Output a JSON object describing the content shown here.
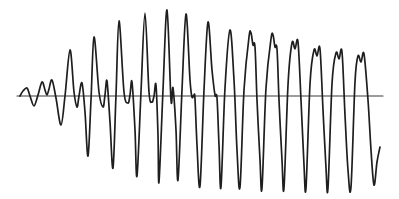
{
  "canvas": {
    "width": 399,
    "height": 199,
    "background": "#ffffff"
  },
  "style": {
    "waveform_stroke": "#1e1e1e",
    "waveform_stroke_width": 1.7,
    "axis_stroke": "#3a3a3a",
    "axis_stroke_width": 1.1
  },
  "chart_data": {
    "type": "line",
    "title": "",
    "xlabel": "",
    "ylabel": "",
    "legend": null,
    "grid": false,
    "annotation": "Hand-drawn waveform trace of an oscillation growing from small ripples into large complex cycles, crossing a single horizontal zero axis",
    "axis_line": {
      "x1": 17,
      "y1": 96,
      "x2": 383,
      "y2": 96
    },
    "series": [
      {
        "name": "waveform",
        "points_px": [
          [
            20,
            96
          ],
          [
            23,
            91
          ],
          [
            27,
            88
          ],
          [
            30,
            96
          ],
          [
            34,
            106
          ],
          [
            38,
            95
          ],
          [
            42,
            82
          ],
          [
            45,
            90
          ],
          [
            47,
            95
          ],
          [
            49,
            89
          ],
          [
            52,
            80
          ],
          [
            56,
            98
          ],
          [
            61,
            125
          ],
          [
            65,
            96
          ],
          [
            70,
            50
          ],
          [
            74,
            92
          ],
          [
            77,
            107
          ],
          [
            79,
            96
          ],
          [
            82,
            83
          ],
          [
            85,
            112
          ],
          [
            88,
            156
          ],
          [
            91,
            100
          ],
          [
            94,
            37
          ],
          [
            99,
            92
          ],
          [
            103,
            107
          ],
          [
            105,
            95
          ],
          [
            107,
            81
          ],
          [
            110,
            122
          ],
          [
            113,
            168
          ],
          [
            116,
            95
          ],
          [
            119,
            21
          ],
          [
            124,
            92
          ],
          [
            128,
            103
          ],
          [
            130,
            95
          ],
          [
            132,
            82
          ],
          [
            135,
            130
          ],
          [
            137,
            176
          ],
          [
            141,
            92
          ],
          [
            145,
            13
          ],
          [
            149,
            92
          ],
          [
            152,
            102
          ],
          [
            154,
            96
          ],
          [
            156,
            85
          ],
          [
            158,
            135
          ],
          [
            159,
            182
          ],
          [
            163,
            90
          ],
          [
            167,
            10
          ],
          [
            171,
            100
          ],
          [
            173,
            88
          ],
          [
            176,
            130
          ],
          [
            178,
            180
          ],
          [
            182,
            90
          ],
          [
            186,
            14
          ],
          [
            190,
            80
          ],
          [
            192,
            97
          ],
          [
            194,
            95
          ],
          [
            195,
            99
          ],
          [
            197,
            145
          ],
          [
            200,
            186
          ],
          [
            204,
            90
          ],
          [
            208,
            22
          ],
          [
            212,
            70
          ],
          [
            215,
            95
          ],
          [
            217,
            98
          ],
          [
            219,
            145
          ],
          [
            221,
            187
          ],
          [
            225,
            88
          ],
          [
            230,
            30
          ],
          [
            234,
            80
          ],
          [
            237,
            150
          ],
          [
            240,
            187
          ],
          [
            244,
            90
          ],
          [
            249,
            37
          ],
          [
            251,
            33
          ],
          [
            253,
            45
          ],
          [
            255,
            47
          ],
          [
            257,
            100
          ],
          [
            260,
            160
          ],
          [
            262,
            188
          ],
          [
            266,
            88
          ],
          [
            271,
            39
          ],
          [
            273,
            35
          ],
          [
            275,
            47
          ],
          [
            277,
            49
          ],
          [
            279,
            100
          ],
          [
            282,
            160
          ],
          [
            284,
            188
          ],
          [
            288,
            85
          ],
          [
            292,
            43
          ],
          [
            295,
            49
          ],
          [
            298,
            42
          ],
          [
            301,
            100
          ],
          [
            304,
            165
          ],
          [
            306,
            188
          ],
          [
            310,
            84
          ],
          [
            314,
            50
          ],
          [
            317,
            56
          ],
          [
            320,
            49
          ],
          [
            323,
            110
          ],
          [
            326,
            168
          ],
          [
            328,
            188
          ],
          [
            332,
            84
          ],
          [
            336,
            53
          ],
          [
            339,
            59
          ],
          [
            342,
            52
          ],
          [
            345,
            115
          ],
          [
            348,
            170
          ],
          [
            351,
            187
          ],
          [
            355,
            82
          ],
          [
            358,
            56
          ],
          [
            361,
            62
          ],
          [
            364,
            54
          ],
          [
            368,
            100
          ],
          [
            371,
            150
          ],
          [
            374,
            185
          ],
          [
            377,
            162
          ],
          [
            380,
            147
          ]
        ]
      }
    ]
  }
}
